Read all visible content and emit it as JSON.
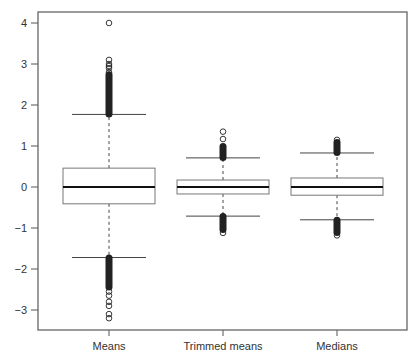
{
  "chart_data": {
    "type": "boxplot",
    "title": "",
    "xlabel": "",
    "ylabel": "",
    "ylim": [
      -3.5,
      4.25
    ],
    "yticks": [
      -3,
      -2,
      -1,
      0,
      1,
      2,
      3,
      4
    ],
    "ytick_labels": [
      "−3",
      "−2",
      "−1",
      "0",
      "1",
      "2",
      "3",
      "4"
    ],
    "grid": false,
    "legend": null,
    "categories": [
      "Means",
      "Trimmed means",
      "Medians"
    ],
    "series": [
      {
        "name": "Means",
        "whisker_low": -1.72,
        "q1": -0.41,
        "median": 0.0,
        "q3": 0.46,
        "whisker_high": 1.77,
        "outliers_high_dense": [
          1.77,
          2.75
        ],
        "outliers_high": [
          2.8,
          2.9,
          2.95,
          3.0,
          3.1,
          4.0
        ],
        "outliers_low_dense": [
          -2.45,
          -1.72
        ],
        "outliers_low": [
          -2.55,
          -2.65,
          -2.8,
          -2.9,
          -3.1,
          -3.2
        ]
      },
      {
        "name": "Trimmed means",
        "whisker_low": -0.71,
        "q1": -0.17,
        "median": 0.0,
        "q3": 0.17,
        "whisker_high": 0.71,
        "outliers_high_dense": [
          0.71,
          1.0
        ],
        "outliers_high": [
          1.17,
          1.35
        ],
        "outliers_low_dense": [
          -1.05,
          -0.71
        ],
        "outliers_low": [
          -1.12
        ]
      },
      {
        "name": "Medians",
        "whisker_low": -0.8,
        "q1": -0.2,
        "median": 0.0,
        "q3": 0.22,
        "whisker_high": 0.83,
        "outliers_high_dense": [
          0.83,
          1.1
        ],
        "outliers_high": [
          1.15
        ],
        "outliers_low_dense": [
          -1.12,
          -0.8
        ],
        "outliers_low": [
          -1.18
        ]
      }
    ]
  },
  "colors": {
    "frame": "#555555",
    "box": "#777777",
    "median": "#111111",
    "whisker": "#444444",
    "outlier": "#222222",
    "text": "#333333"
  }
}
